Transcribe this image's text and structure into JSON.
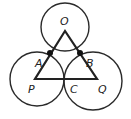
{
  "diagram": {
    "colors": {
      "stroke": "#2a2a2a",
      "background": "#ffffff"
    },
    "circles": [
      {
        "name": "O",
        "cx": 65,
        "cy": 27,
        "r": 24
      },
      {
        "name": "P",
        "cx": 37,
        "cy": 79,
        "r": 27
      },
      {
        "name": "Q",
        "cx": 93,
        "cy": 81,
        "r": 29
      }
    ],
    "triangle": {
      "points": "65,31 35,79 97,79"
    },
    "points": [
      {
        "name": "A",
        "x": 50,
        "y": 53
      },
      {
        "name": "B",
        "x": 80,
        "y": 53
      }
    ],
    "labels": {
      "O": "O",
      "A": "A",
      "B": "B",
      "P": "P",
      "C": "C",
      "Q": "Q"
    }
  }
}
